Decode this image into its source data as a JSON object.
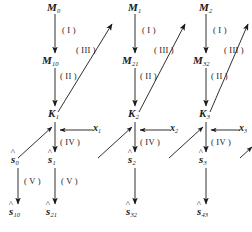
{
  "figure": {
    "type": "commutative-diagram",
    "background_color": "#ffffff",
    "ink_color": "#1a1a1a"
  },
  "nodes": {
    "top_row": [
      {
        "base": "M",
        "sub": "0"
      },
      {
        "base": "M",
        "sub": "1"
      },
      {
        "base": "M",
        "sub": "2"
      }
    ],
    "second_row": [
      {
        "base": "M",
        "sub": "10"
      },
      {
        "base": "M",
        "sub": "21"
      },
      {
        "base": "M",
        "sub": "32"
      }
    ],
    "k_row": [
      {
        "base": "K",
        "sub": "1"
      },
      {
        "base": "K",
        "sub": "2"
      },
      {
        "base": "K",
        "sub": "3"
      }
    ],
    "shat_row": [
      {
        "base": "s",
        "sub": "0",
        "accent": "^"
      },
      {
        "base": "s",
        "sub": "1",
        "accent": "^"
      },
      {
        "base": "s",
        "sub": "2",
        "accent": "^"
      },
      {
        "base": "s",
        "sub": "3",
        "accent": "^"
      }
    ],
    "bottom_row": [
      {
        "base": "s",
        "sub": "10",
        "accent": "^"
      },
      {
        "base": "s",
        "sub": "21",
        "accent": "^"
      },
      {
        "base": "s",
        "sub": "32",
        "accent": "^"
      },
      {
        "base": "s",
        "sub": "43",
        "accent": "^"
      }
    ]
  },
  "arrow_labels": {
    "stage_one": "( I )",
    "stage_two": "( II )",
    "stage_three": "( III )",
    "stage_four": "( IV )",
    "stage_five": "( V )"
  },
  "inputs": [
    {
      "base": "x",
      "sub": "1"
    },
    {
      "base": "x",
      "sub": "2"
    },
    {
      "base": "x",
      "sub": "3"
    }
  ],
  "label_instances": {
    "roman_I": [
      "( I )",
      "( I )",
      "( I )"
    ],
    "roman_II": [
      "( II )",
      "( II )",
      "( II )"
    ],
    "roman_III": [
      "( III )",
      "( III )",
      "( III )"
    ],
    "roman_IV": [
      "( IV )",
      "( IV )",
      "( IV )"
    ],
    "roman_V": [
      "( V )",
      "( V )"
    ]
  }
}
